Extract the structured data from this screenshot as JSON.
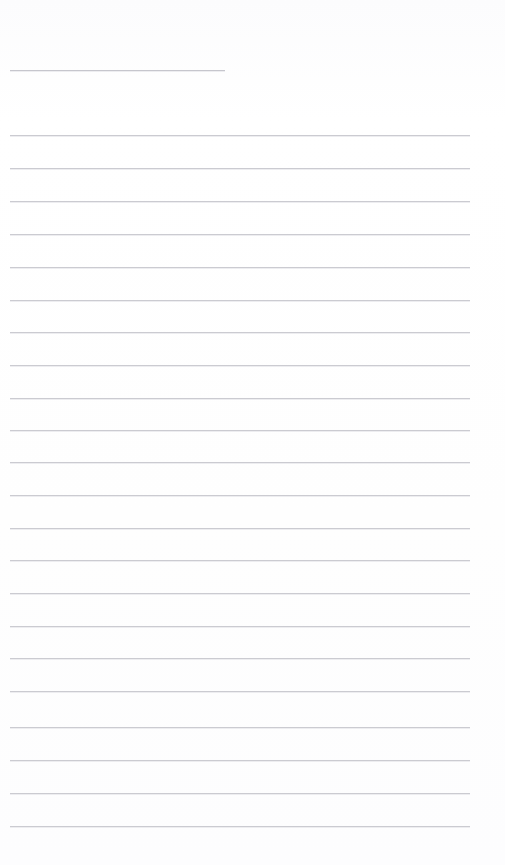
{
  "page": {
    "kind": "lined-paper-page",
    "width_px": 505,
    "height_px": 865,
    "background_color": "#fdfdfd",
    "rule_color": "#c9c9cf",
    "content_text": "",
    "notes_label": ""
  },
  "margins": {
    "left_px": 10,
    "right_px": 470,
    "short_rule_right_px": 225
  },
  "rules": [
    {
      "name": "header-rule",
      "y": 70,
      "x1": 10,
      "x2": 225,
      "variant": "short"
    },
    {
      "name": "rule-1",
      "y": 135,
      "x1": 10,
      "x2": 470,
      "variant": "full"
    },
    {
      "name": "rule-2",
      "y": 168,
      "x1": 10,
      "x2": 470,
      "variant": "full"
    },
    {
      "name": "rule-3",
      "y": 201,
      "x1": 10,
      "x2": 470,
      "variant": "full"
    },
    {
      "name": "rule-4",
      "y": 234,
      "x1": 10,
      "x2": 470,
      "variant": "full"
    },
    {
      "name": "rule-5",
      "y": 267,
      "x1": 10,
      "x2": 470,
      "variant": "full"
    },
    {
      "name": "rule-6",
      "y": 300,
      "x1": 10,
      "x2": 470,
      "variant": "full"
    },
    {
      "name": "rule-7",
      "y": 332,
      "x1": 10,
      "x2": 470,
      "variant": "full"
    },
    {
      "name": "rule-8",
      "y": 365,
      "x1": 10,
      "x2": 470,
      "variant": "full"
    },
    {
      "name": "rule-9",
      "y": 398,
      "x1": 10,
      "x2": 470,
      "variant": "full"
    },
    {
      "name": "rule-10",
      "y": 430,
      "x1": 10,
      "x2": 470,
      "variant": "full"
    },
    {
      "name": "rule-11",
      "y": 462,
      "x1": 10,
      "x2": 470,
      "variant": "full"
    },
    {
      "name": "rule-12",
      "y": 495,
      "x1": 10,
      "x2": 470,
      "variant": "full"
    },
    {
      "name": "rule-13",
      "y": 528,
      "x1": 10,
      "x2": 470,
      "variant": "full"
    },
    {
      "name": "rule-14",
      "y": 560,
      "x1": 10,
      "x2": 470,
      "variant": "full"
    },
    {
      "name": "rule-15",
      "y": 593,
      "x1": 10,
      "x2": 470,
      "variant": "full"
    },
    {
      "name": "rule-16",
      "y": 626,
      "x1": 10,
      "x2": 470,
      "variant": "full"
    },
    {
      "name": "rule-17",
      "y": 658,
      "x1": 10,
      "x2": 470,
      "variant": "full"
    },
    {
      "name": "rule-18",
      "y": 691,
      "x1": 10,
      "x2": 470,
      "variant": "full"
    },
    {
      "name": "rule-19",
      "y": 727,
      "x1": 10,
      "x2": 470,
      "variant": "full"
    },
    {
      "name": "rule-20",
      "y": 760,
      "x1": 10,
      "x2": 470,
      "variant": "full"
    },
    {
      "name": "rule-21",
      "y": 793,
      "x1": 10,
      "x2": 470,
      "variant": "full"
    },
    {
      "name": "rule-22",
      "y": 826,
      "x1": 10,
      "x2": 470,
      "variant": "full"
    }
  ]
}
